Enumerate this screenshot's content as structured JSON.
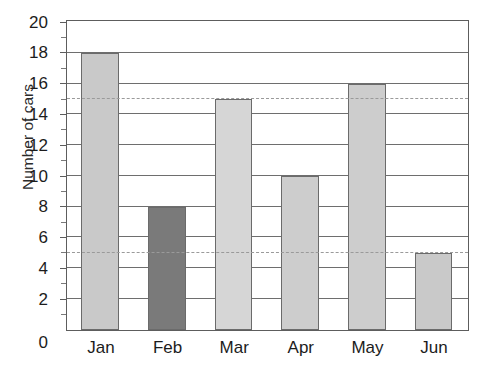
{
  "chart_data": {
    "type": "bar",
    "title": "",
    "xlabel": "",
    "ylabel": "Number of cars",
    "categories": [
      "Jan",
      "Feb",
      "Mar",
      "Apr",
      "May",
      "Jun"
    ],
    "values": [
      18,
      8,
      15,
      10,
      16,
      5
    ],
    "bar_colors": [
      "#c9c9c9",
      "#7a7a7a",
      "#d6d6d6",
      "#cdcdcd",
      "#cdcdcd",
      "#c9c9c9"
    ],
    "highlighted_category": "Feb",
    "ylim": [
      0,
      20
    ],
    "y_ticks": [
      0,
      2,
      4,
      6,
      8,
      10,
      12,
      14,
      16,
      18,
      20
    ],
    "y_tick_labels": [
      "0",
      "2",
      "4",
      "6",
      "8",
      "10",
      "12",
      "14",
      "16",
      "18",
      "20"
    ],
    "y_minor_ticks": [
      1,
      3,
      5,
      7,
      9,
      11,
      13,
      15,
      17,
      19
    ],
    "grid": "horizontal",
    "gridline_color": "#6e6e6e",
    "reference_lines": [
      {
        "value": 15,
        "style": "dashed",
        "color": "#9a9a9a"
      },
      {
        "value": 5,
        "style": "dashed",
        "color": "#9a9a9a"
      }
    ],
    "legend": null,
    "legend_position": "none",
    "axis_color": "#5d5d5d",
    "bar_border_color": "#6b6b6b",
    "background": "#ffffff"
  },
  "caption": {
    "top_clipped_text": ""
  }
}
